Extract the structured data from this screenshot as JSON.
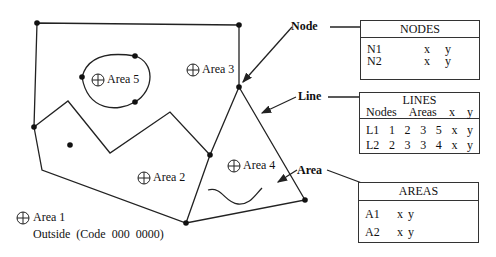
{
  "map": {
    "areas": [
      {
        "id": "area1",
        "label": "Area 1"
      },
      {
        "id": "area2",
        "label": "Area 2"
      },
      {
        "id": "area3",
        "label": "Area 3"
      },
      {
        "id": "area4",
        "label": "Area 4"
      },
      {
        "id": "area5",
        "label": "Area 5"
      }
    ],
    "outside_label": "Outside  (Code  000  0000)"
  },
  "callouts": {
    "node": "Node",
    "line": "Line",
    "area": "Area"
  },
  "tables": {
    "nodes": {
      "title": "NODES",
      "rows": [
        {
          "id": "N1",
          "x": "x",
          "y": "y"
        },
        {
          "id": "N2",
          "x": "x",
          "y": "y"
        }
      ]
    },
    "lines": {
      "title": "LINES",
      "headers": {
        "nodes": "Nodes",
        "areas": "Areas",
        "x": "x",
        "y": "y"
      },
      "rows": [
        {
          "id": "L1",
          "n1": "1",
          "n2": "2",
          "a1": "3",
          "a2": "5",
          "x": "x",
          "y": "y"
        },
        {
          "id": "L2",
          "n1": "2",
          "n2": "3",
          "a1": "3",
          "a2": "4",
          "x": "x",
          "y": "y"
        }
      ]
    },
    "areas": {
      "title": "AREAS",
      "rows": [
        {
          "id": "A1",
          "x": "x",
          "y": "y"
        },
        {
          "id": "A2",
          "x": "x",
          "y": "y"
        }
      ]
    }
  },
  "colors": {
    "stroke": "#222222",
    "background": "#ffffff"
  }
}
